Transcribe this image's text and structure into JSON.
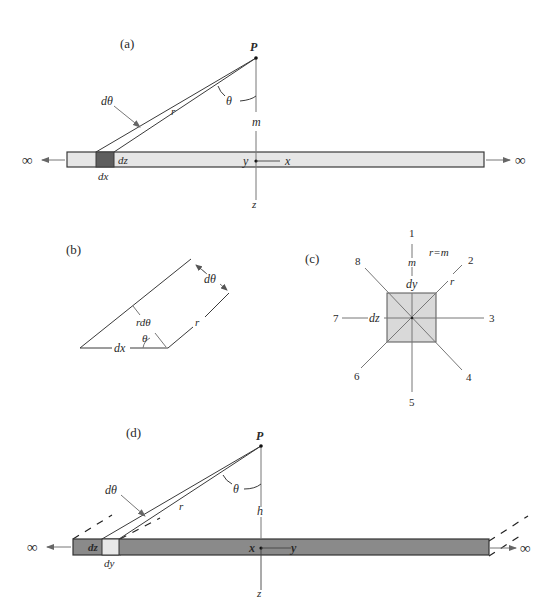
{
  "figure": {
    "colors": {
      "light_fill": "#e6e6e6",
      "dark_element": "#5e5e5e",
      "dark_strip": "#8a8a8a",
      "light_element": "#e8e8e8",
      "square_fill": "#d9d9d9",
      "stroke": "#3a3a3a"
    },
    "panel_a": {
      "label": "(a)",
      "point_label": "P",
      "angle_label": "θ",
      "dtheta_label": "dθ",
      "r_label": "r",
      "m_label": "m",
      "dz_label": "dz",
      "dx_label": "dx",
      "y_label": "y",
      "x_label": "x",
      "z_label": "z",
      "left_infinity": "∞",
      "right_infinity": "∞"
    },
    "panel_b": {
      "label": "(b)",
      "dtheta_label": "dθ",
      "rdtheta_label": "rdθ",
      "r_label": "r",
      "theta_label": "θ",
      "dx_label": "dx"
    },
    "panel_c": {
      "label": "(c)",
      "equation": "r=m",
      "m_label": "m",
      "dy_label": "dy",
      "dz_label": "dz",
      "r_label": "r",
      "directions": [
        "1",
        "2",
        "3",
        "4",
        "5",
        "6",
        "7",
        "8"
      ]
    },
    "panel_d": {
      "label": "(d)",
      "point_label": "P",
      "angle_label": "θ",
      "dtheta_label": "dθ",
      "r_label": "r",
      "h_label": "h",
      "dz_label": "dz",
      "dy_label": "dy",
      "x_label": "x",
      "y_label": "y",
      "z_label": "z",
      "left_infinity": "∞",
      "right_infinity": "∞"
    }
  }
}
